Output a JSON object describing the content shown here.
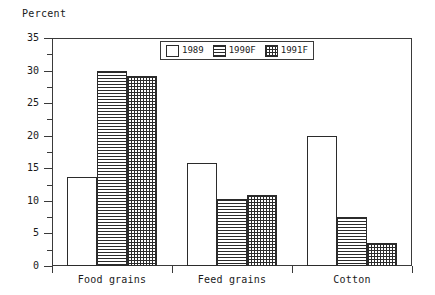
{
  "chart_data": {
    "type": "bar",
    "title": "",
    "subtitle": "",
    "ylabel": "Percent",
    "xlabel": "",
    "ylim": [
      0,
      35
    ],
    "yticks": [
      0,
      5,
      10,
      15,
      20,
      25,
      30,
      35
    ],
    "ytick_labels": [
      "0",
      "5",
      "10",
      "15",
      "20",
      "25",
      "30",
      "35"
    ],
    "minor_tick_step": 2.5,
    "grid": false,
    "legend_position": "top-center",
    "categories": [
      "Food grains",
      "Feed grains",
      "Cotton"
    ],
    "series": [
      {
        "name": "1989",
        "pattern": "blank",
        "values": [
          13.7,
          15.8,
          20.0
        ]
      },
      {
        "name": "1990F",
        "pattern": "hlines",
        "values": [
          30.0,
          10.3,
          7.5
        ]
      },
      {
        "name": "1991F",
        "pattern": "grid",
        "values": [
          29.2,
          10.9,
          3.5
        ]
      }
    ],
    "colors": {
      "axis": "#3a3a3a",
      "bar_outline": "#2b2b2b",
      "bar_fill": "#2b2b2b",
      "background": "#ffffff"
    }
  },
  "legend": {
    "entries": [
      {
        "label": "1989",
        "swatch": "blank-swatch"
      },
      {
        "label": "1990F",
        "swatch": "hlines-swatch"
      },
      {
        "label": "1991F",
        "swatch": "grid-swatch"
      }
    ]
  }
}
